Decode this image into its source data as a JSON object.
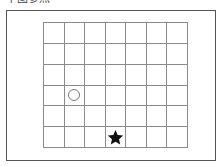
{
  "caption": {
    "text": "下图参照",
    "note": "partially clipped at top edge"
  },
  "grid": {
    "columns": 7,
    "rows": 6,
    "line_color": "#8a8a8a"
  },
  "markers": [
    {
      "type": "circle",
      "name": "circle-marker",
      "row": 3,
      "col": 1,
      "color": "#777777"
    },
    {
      "type": "star",
      "name": "star-marker",
      "row": 5,
      "col": 3,
      "color": "#111111"
    }
  ]
}
